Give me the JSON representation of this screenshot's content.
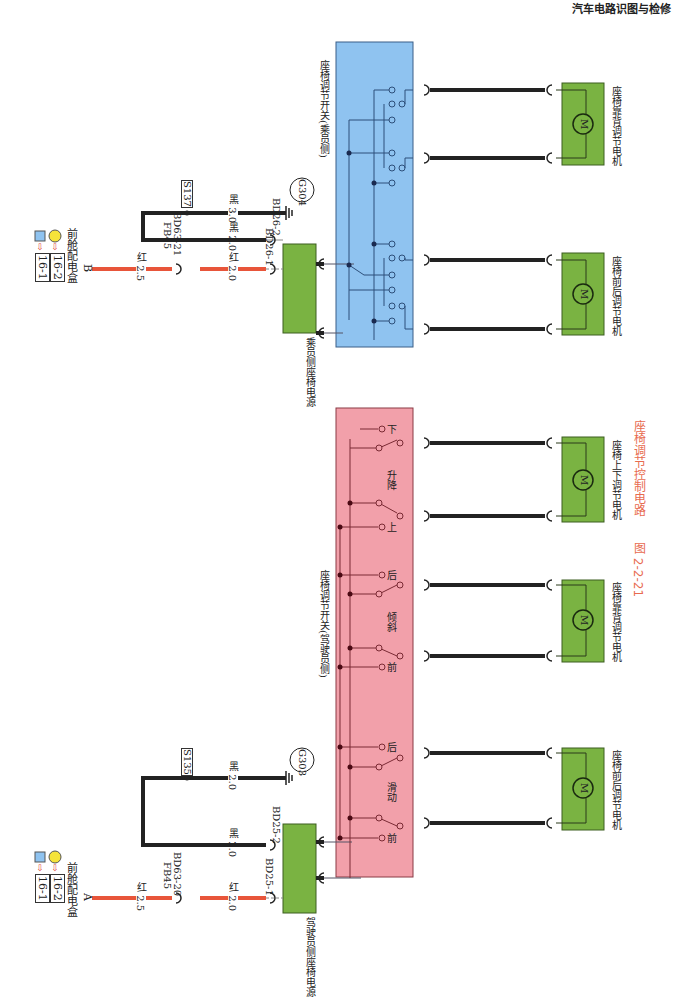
{
  "header": {
    "title": "汽车电路识图与检修"
  },
  "figure": {
    "number": "图 2-2-21",
    "caption": "座椅调节控制电路"
  },
  "colors": {
    "passenger_switch_bg": "#8fc3f0",
    "driver_switch_bg": "#f2a0aa",
    "component_green": "#7ab342",
    "power_wire": "#e8553a",
    "ground_wire": "#222222",
    "caption": "#e86b4f"
  },
  "sources": [
    {
      "id": "B",
      "name": "前舱配电盒",
      "refs": [
        "16-1",
        "16-2"
      ]
    },
    {
      "id": "A",
      "name": "前舱配电盒",
      "refs": [
        "16-1",
        "16-2"
      ]
    }
  ],
  "passenger": {
    "power_module": "乘员侧座椅电源",
    "wire_in_1": "红 2.5",
    "fuse": "FB45",
    "connector_fuse": "BD63-21",
    "wire_in_2": "红 2.0",
    "pin_1": "BD26-1",
    "pin_2": "BD26-2",
    "ground_wire_1": "黑 2.0",
    "ground_wire_2": "黑 3.0",
    "splice": "S137",
    "ground": "G304",
    "switch_name": "座椅调节开关(乘员侧)",
    "motors": [
      {
        "name": "座椅靠背调节电机",
        "symbol": "M"
      },
      {
        "name": "座椅前后调节电机",
        "symbol": "M"
      }
    ]
  },
  "driver": {
    "power_module": "驾驶员侧座椅电源",
    "wire_in_1": "红 2.5",
    "fuse": "FB45",
    "connector_fuse": "BD63-20",
    "wire_in_2": "红 2.0",
    "pin_1": "BD25-1",
    "pin_2": "BD25-2",
    "ground_wire_1": "黑 2.0",
    "ground_wire_2": "黑 2.0",
    "splice": "S135",
    "ground": "G303",
    "switch_name": "座椅调节开关(驾驶员侧)",
    "switch_groups": [
      {
        "name": "升降",
        "pos_a": "上",
        "pos_b": "下"
      },
      {
        "name": "倾斜",
        "pos_a": "前",
        "pos_b": "后"
      },
      {
        "name": "滑动",
        "pos_a": "前",
        "pos_b": "后"
      }
    ],
    "motors": [
      {
        "name": "座椅上下调节电机",
        "symbol": "M"
      },
      {
        "name": "座椅靠背调节电机",
        "symbol": "M"
      },
      {
        "name": "座椅前后调节电机",
        "symbol": "M"
      }
    ]
  }
}
